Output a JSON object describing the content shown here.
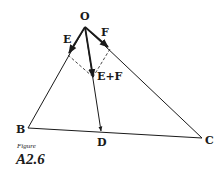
{
  "diagram": {
    "points": {
      "O": {
        "label": "O",
        "x": 85,
        "y": 27
      },
      "B": {
        "label": "B",
        "x": 28,
        "y": 128
      },
      "C": {
        "label": "C",
        "x": 202,
        "y": 138
      },
      "D": {
        "label": "D",
        "x": 101,
        "y": 132
      }
    },
    "vectors": {
      "E": {
        "label": "E"
      },
      "F": {
        "label": "F"
      },
      "sum": {
        "label": "E+F"
      }
    },
    "caption": {
      "prefix": "Figure",
      "number": "A2.6"
    },
    "colors": {
      "ink": "#1a1a1a",
      "background": "#ffffff"
    }
  }
}
